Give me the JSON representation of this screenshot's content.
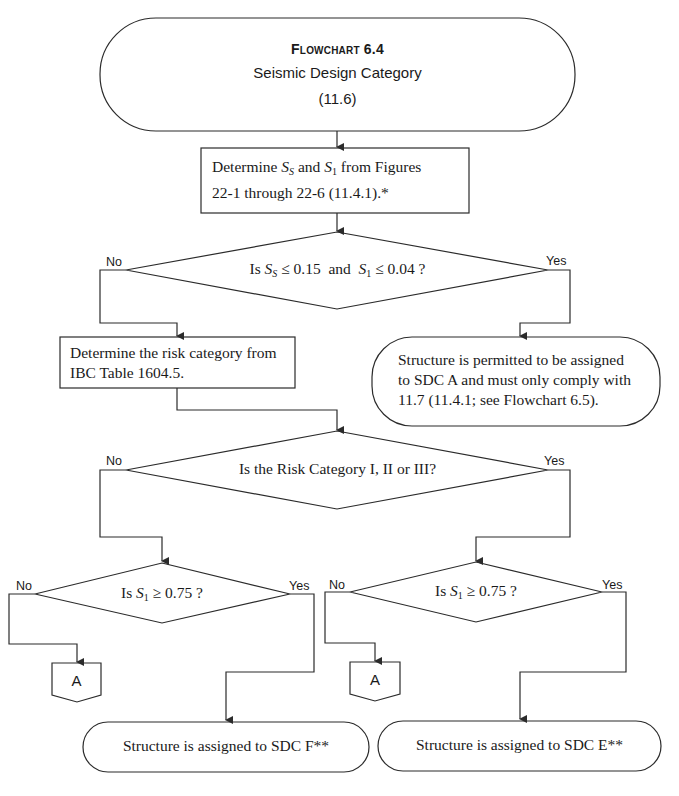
{
  "header": {
    "title": "Flowchart 6.4",
    "subtitle": "Seismic Design Category",
    "section": "(11.6)"
  },
  "steps": {
    "determine_ss_s1": {
      "prefix": "Determine ",
      "var1": "S",
      "var1_sub": "S",
      "mid": " and ",
      "var2": "S",
      "var2_sub": "1",
      "suffix": " from Figures",
      "line2": "22-1 through 22-6 (11.4.1).*"
    },
    "determine_risk": {
      "line1": "Determine the risk category from",
      "line2": "IBC Table 1604.5."
    }
  },
  "decisions": {
    "low_seismicity": {
      "prefix": "Is ",
      "var1": "S",
      "var1_sub": "S",
      "mid": " ≤ 0.15  and  ",
      "var2": "S",
      "var2_sub": "1",
      "suffix": " ≤ 0.04 ?",
      "no_label": "No",
      "yes_label": "Yes"
    },
    "risk_category": {
      "text": "Is the Risk Category I, II or III?",
      "no_label": "No",
      "yes_label": "Yes"
    },
    "s1_left": {
      "prefix": "Is ",
      "var": "S",
      "var_sub": "1",
      "suffix": " ≥ 0.75 ?",
      "no_label": "No",
      "yes_label": "Yes"
    },
    "s1_right": {
      "prefix": "Is ",
      "var": "S",
      "var_sub": "1",
      "suffix": " ≥ 0.75 ?",
      "no_label": "No",
      "yes_label": "Yes"
    }
  },
  "terminals": {
    "sdc_a": {
      "line1": "Structure is permitted to be assigned",
      "line2": "to SDC A and must only comply with",
      "line3": "11.7 (11.4.1; see Flowchart 6.5)."
    },
    "sdc_f": {
      "text": "Structure is assigned to SDC F**"
    },
    "sdc_e": {
      "text": "Structure is assigned to SDC E**"
    }
  },
  "connectors": {
    "left": {
      "label": "A"
    },
    "right": {
      "label": "A"
    }
  },
  "colors": {
    "stroke": "#2b2b2b",
    "text": "#1a1a1a",
    "background": "#ffffff"
  }
}
